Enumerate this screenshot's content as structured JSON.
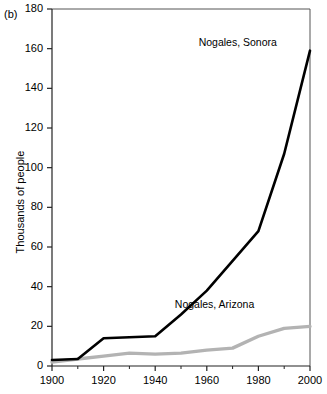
{
  "figure": {
    "panel_label": "(b)",
    "ylabel": "Thousands of people"
  },
  "chart_data": {
    "type": "line",
    "title": "",
    "xlabel": "",
    "ylabel": "Thousands of people",
    "xlim": [
      1900,
      2000
    ],
    "ylim": [
      0,
      180
    ],
    "xticks": [
      1900,
      1920,
      1940,
      1960,
      1980,
      2000
    ],
    "yticks": [
      0,
      20,
      40,
      60,
      80,
      100,
      120,
      140,
      160,
      180
    ],
    "xtick_labels": [
      "1900",
      "1920",
      "1940",
      "1960",
      "1980",
      "2000"
    ],
    "ytick_labels": [
      "0",
      "20",
      "40",
      "60",
      "80",
      "100",
      "120",
      "140",
      "160",
      "180"
    ],
    "grid": false,
    "legend": "inline-annotations",
    "series": [
      {
        "name": "Nogales, Sonora",
        "color": "#000000",
        "linewidth": 2.6,
        "x": [
          1900,
          1910,
          1920,
          1930,
          1940,
          1950,
          1960,
          1970,
          1980,
          1990,
          2000
        ],
        "values": [
          3,
          3.5,
          14,
          14.5,
          15,
          26,
          38,
          53,
          68,
          107,
          159
        ]
      },
      {
        "name": "Nogales, Arizona",
        "color": "#b3b3b3",
        "linewidth": 3.4,
        "x": [
          1900,
          1910,
          1920,
          1930,
          1940,
          1950,
          1960,
          1970,
          1980,
          1990,
          2000
        ],
        "values": [
          2,
          3.5,
          5,
          6.5,
          6,
          6.5,
          8,
          9,
          15,
          19,
          20
        ]
      }
    ],
    "annotations": [
      {
        "text": "Nogales, Sonora",
        "x": 1972,
        "y": 163
      },
      {
        "text": "Nogales, Arizona",
        "x": 1963,
        "y": 31
      }
    ]
  }
}
